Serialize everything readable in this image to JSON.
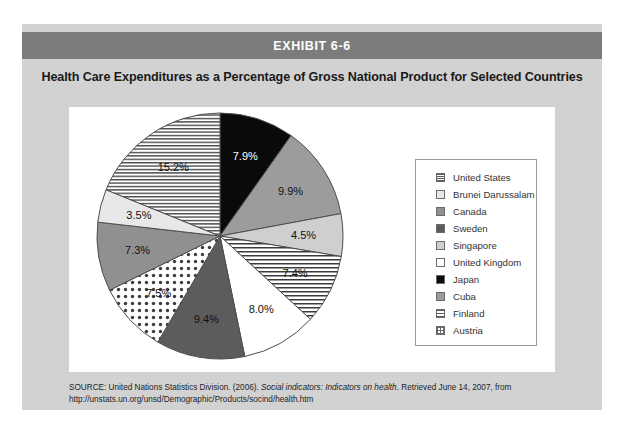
{
  "exhibit": {
    "band_label": "EXHIBIT 6-6",
    "title": "Health Care Expenditures as a Percentage of Gross National Product for Selected Countries"
  },
  "source": {
    "prefix": "SOURCE: United Nations Statistics Division. (2006). ",
    "italic": "Social indicators: Indicators on health",
    "suffix": ". Retrieved June 14, 2007, from http://unstats.un.org/unsd/Demographic/Products/socind/health.htm"
  },
  "legend": {
    "items": [
      {
        "label": "United States",
        "swatch": "hstripe-fine"
      },
      {
        "label": "Brunei Darussalam",
        "swatch": "verylight"
      },
      {
        "label": "Canada",
        "swatch": "medgrey"
      },
      {
        "label": "Sweden",
        "swatch": "darkgrey"
      },
      {
        "label": "Singapore",
        "swatch": "lightgrey"
      },
      {
        "label": "United Kingdom",
        "swatch": "white"
      },
      {
        "label": "Japan",
        "swatch": "black"
      },
      {
        "label": "Cuba",
        "swatch": "midgrey"
      },
      {
        "label": "Finland",
        "swatch": "hstripe"
      },
      {
        "label": "Austria",
        "swatch": "grid"
      }
    ]
  },
  "chart_data": {
    "type": "pie",
    "title": "Health Care Expenditures as a Percentage of Gross National Product for Selected Countries",
    "xlabel": "",
    "ylabel": "",
    "value_unit": "% of GNP",
    "legend_position": "right",
    "start_angle_deg": 0,
    "direction": "clockwise",
    "categories": [
      "Japan",
      "Cuba",
      "Singapore",
      "Finland",
      "United Kingdom",
      "Sweden",
      "Austria",
      "Canada",
      "Brunei Darussalam",
      "United States"
    ],
    "values": [
      7.9,
      9.9,
      4.5,
      7.4,
      8.0,
      9.4,
      7.5,
      7.3,
      3.5,
      15.2
    ],
    "labels": [
      "7.9%",
      "9.9%",
      "4.5%",
      "7.4%",
      "8.0%",
      "9.4%",
      "7.5%",
      "7.3%",
      "3.5%",
      "15.2%"
    ],
    "slices": [
      {
        "country": "Japan",
        "value": 7.9,
        "label": "7.9%",
        "fill": "#0a0a0a",
        "pattern": "solid-black",
        "label_color": "#ffffff"
      },
      {
        "country": "Cuba",
        "value": 9.9,
        "label": "9.9%",
        "fill": "#9c9c9c",
        "pattern": "solid-midgrey",
        "label_color": "#111111"
      },
      {
        "country": "Singapore",
        "value": 4.5,
        "label": "4.5%",
        "fill": "#cfcfcf",
        "pattern": "solid-lightgrey",
        "label_color": "#111111"
      },
      {
        "country": "Finland",
        "value": 7.4,
        "label": "7.4%",
        "fill": "#ffffff",
        "pattern": "horizontal-stripes",
        "label_color": "#111111"
      },
      {
        "country": "United Kingdom",
        "value": 8.0,
        "label": "8.0%",
        "fill": "#ffffff",
        "pattern": "solid-white",
        "label_color": "#111111"
      },
      {
        "country": "Sweden",
        "value": 9.4,
        "label": "9.4%",
        "fill": "#5c5c5c",
        "pattern": "solid-darkgrey",
        "label_color": "#111111"
      },
      {
        "country": "Austria",
        "value": 7.5,
        "label": "7.5%",
        "fill": "#ffffff",
        "pattern": "dots",
        "label_color": "#111111"
      },
      {
        "country": "Canada",
        "value": 7.3,
        "label": "7.3%",
        "fill": "#909090",
        "pattern": "solid-medgrey",
        "label_color": "#111111"
      },
      {
        "country": "Brunei Darussalam",
        "value": 3.5,
        "label": "3.5%",
        "fill": "#e8e8e8",
        "pattern": "solid-verylight",
        "label_color": "#111111"
      },
      {
        "country": "United States",
        "value": 15.2,
        "label": "15.2%",
        "fill": "#ffffff",
        "pattern": "horizontal-stripes-fine",
        "label_color": "#111111"
      }
    ],
    "total": 84.6
  }
}
